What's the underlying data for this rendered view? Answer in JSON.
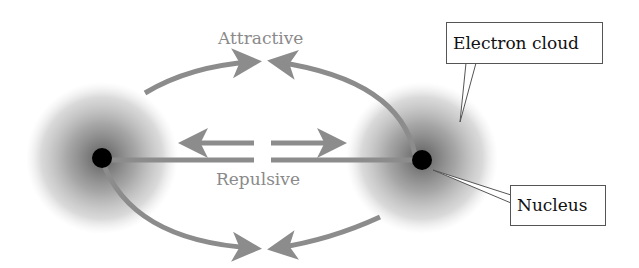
{
  "labels": {
    "attractive": "Attractive",
    "repulsive": "Repulsive",
    "electron_cloud": "Electron cloud",
    "nucleus": "Nucleus"
  },
  "colors": {
    "arrow": "#8c8c8c",
    "nucleus": "#000000",
    "cloud": "#7a7a7a",
    "text_gray": "#8a8a8a"
  }
}
